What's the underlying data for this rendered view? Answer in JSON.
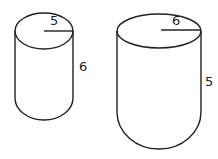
{
  "figures": [
    {
      "name": "left-solid",
      "shape": "cylinder with hemispherical bottom",
      "radius_label": "5",
      "height_label": "6"
    },
    {
      "name": "right-solid",
      "shape": "cylinder with hemispherical bottom",
      "radius_label": "6",
      "height_label": "5"
    }
  ],
  "colors": {
    "stroke": "#222222",
    "background": "#ffffff"
  }
}
